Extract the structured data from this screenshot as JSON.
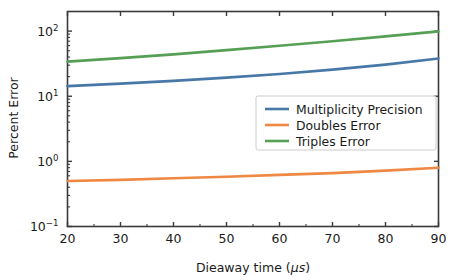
{
  "chart_data": {
    "type": "line",
    "title": "",
    "xlabel": "Dieaway time (μs)",
    "ylabel": "Percent Error",
    "xscale": "linear",
    "yscale": "log",
    "xlim": [
      20,
      90
    ],
    "ylim": [
      0.1,
      200
    ],
    "grid": false,
    "legend_position": "center-right",
    "xticks": [
      20,
      30,
      40,
      50,
      60,
      70,
      80,
      90
    ],
    "xtick_labels": [
      "20",
      "30",
      "40",
      "50",
      "60",
      "70",
      "80",
      "90"
    ],
    "yticks": [
      0.1,
      1,
      10,
      100
    ],
    "ytick_labels": [
      "10−1",
      "10⁰",
      "10¹",
      "10²"
    ],
    "ytick_label_parts": [
      {
        "base": "10",
        "exp": "-1"
      },
      {
        "base": "10",
        "exp": "0"
      },
      {
        "base": "10",
        "exp": "1"
      },
      {
        "base": "10",
        "exp": "2"
      }
    ],
    "x": [
      20,
      30,
      40,
      50,
      60,
      70,
      80,
      90
    ],
    "series": [
      {
        "name": "Multiplicity Precision",
        "color": "#4878a8",
        "values": [
          14.3,
          15.6,
          17.2,
          19.3,
          22.0,
          25.6,
          30.6,
          38.0
        ]
      },
      {
        "name": "Doubles Error",
        "color": "#ee8843",
        "values": [
          0.5,
          0.52,
          0.55,
          0.58,
          0.62,
          0.66,
          0.72,
          0.8
        ]
      },
      {
        "name": "Triples Error",
        "color": "#55a055",
        "values": [
          34.0,
          38.5,
          44.0,
          51.0,
          59.5,
          70.0,
          83.0,
          99.0
        ]
      }
    ]
  },
  "legend": {
    "entries": [
      {
        "label": "Multiplicity Precision",
        "color": "#4878a8"
      },
      {
        "label": "Doubles Error",
        "color": "#ee8843"
      },
      {
        "label": "Triples Error",
        "color": "#55a055"
      }
    ]
  },
  "axes": {
    "x_title": "Dieaway time (μs)",
    "y_title": "Percent Error"
  }
}
